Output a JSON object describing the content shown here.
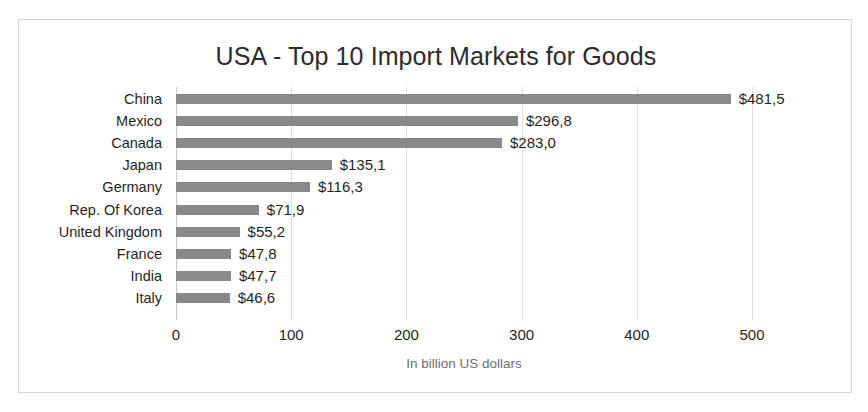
{
  "chart_data": {
    "type": "bar",
    "orientation": "horizontal",
    "title": "USA - Top 10 Import Markets for Goods",
    "xlabel": "In billion US dollars",
    "ylabel": "",
    "xlim": [
      0,
      500
    ],
    "xticks": [
      0,
      100,
      200,
      300,
      400,
      500
    ],
    "xtick_labels": [
      "0",
      "100",
      "200",
      "300",
      "400",
      "500"
    ],
    "grid": true,
    "legend": false,
    "bar_color": "#7f7f7f",
    "categories": [
      "China",
      "Mexico",
      "Canada",
      "Japan",
      "Germany",
      "Rep. Of Korea",
      "United Kingdom",
      "France",
      "India",
      "Italy"
    ],
    "values": [
      481.5,
      296.8,
      283.0,
      135.1,
      116.3,
      71.9,
      55.2,
      47.8,
      47.7,
      46.6
    ],
    "data_labels": [
      "$481,5",
      "$296,8",
      "$283,0",
      "$135,1",
      "$116,3",
      "$71,9",
      "$55,2",
      "$47,8",
      "$47,7",
      "$46,6"
    ]
  }
}
